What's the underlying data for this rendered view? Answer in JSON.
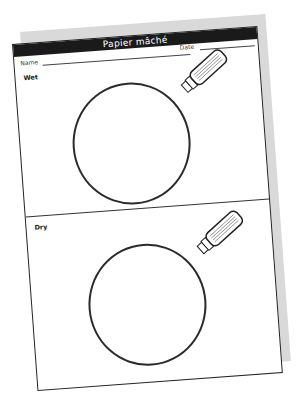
{
  "worksheet": {
    "title": "Papier mâché",
    "name_label": "Name",
    "date_label": "Date",
    "sections": [
      {
        "label": "Wet"
      },
      {
        "label": "Dry"
      }
    ]
  },
  "colors": {
    "title_bar": "#1a1a1a",
    "title_text": "#ffffff",
    "ink": "#222222",
    "shadow": "#d9d9d9"
  }
}
